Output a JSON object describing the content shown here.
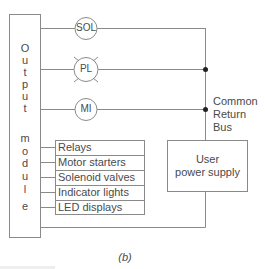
{
  "diagram": {
    "module_label_letters": [
      "O",
      "u",
      "t",
      "p",
      "u",
      "t",
      "m",
      "o",
      "d",
      "u",
      "l",
      "e"
    ],
    "module_label": "Output module",
    "loads": [
      {
        "symbol": "SOL",
        "name": "solenoid"
      },
      {
        "symbol": "PL",
        "name": "pilot-light"
      },
      {
        "symbol": "MI",
        "name": "motor"
      }
    ],
    "bus_label": [
      "Common",
      "Return",
      "Bus"
    ],
    "device_list": [
      "Relays",
      "Motor starters",
      "Solenoid valves",
      "Indicator lights",
      "LED displays"
    ],
    "power_supply_label": [
      "User",
      "power supply"
    ],
    "caption": "(b)",
    "colors": {
      "line": "#8a8a8a",
      "dot": "#222222",
      "text": "#4a4a4a"
    }
  }
}
